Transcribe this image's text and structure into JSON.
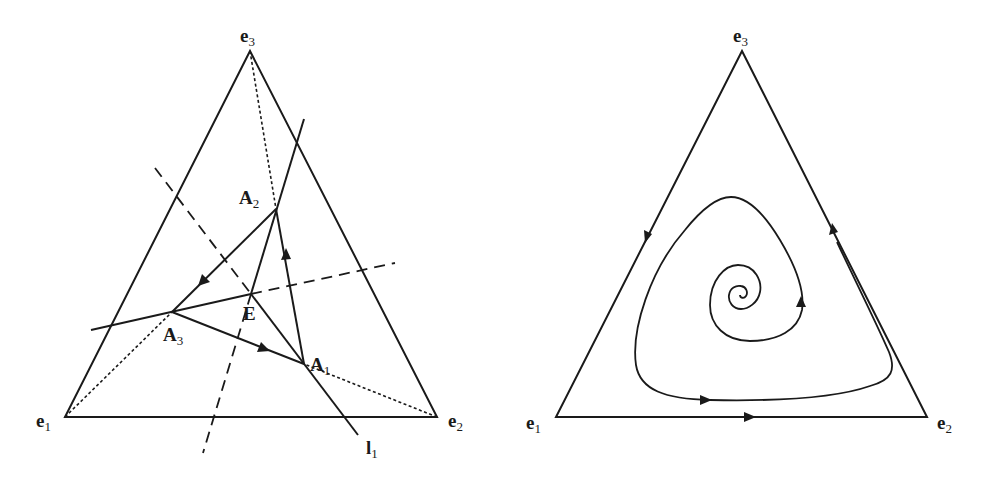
{
  "figure": {
    "panels": [
      {
        "id": "left",
        "description": "Simplex with equilibrium E and triangle A1A2A3",
        "vertices": {
          "e1": {
            "label": "e",
            "sub": "1",
            "x": 65,
            "y": 417
          },
          "e2": {
            "label": "e",
            "sub": "2",
            "x": 437,
            "y": 417
          },
          "e3": {
            "label": "e",
            "sub": "3",
            "x": 250,
            "y": 51
          }
        },
        "points": {
          "A1": {
            "label": "A",
            "sub": "1",
            "x": 304,
            "y": 364
          },
          "A2": {
            "label": "A",
            "sub": "2",
            "x": 276,
            "y": 209
          },
          "A3": {
            "label": "A",
            "sub": "3",
            "x": 172,
            "y": 312
          },
          "E": {
            "label": "E",
            "x": 251,
            "y": 294
          }
        },
        "line_label": {
          "label": "l",
          "sub": "1"
        }
      },
      {
        "id": "right",
        "description": "Simplex with spiral orbit and boundary cycle",
        "vertices": {
          "e1": {
            "label": "e",
            "sub": "1",
            "x": 556,
            "y": 417
          },
          "e2": {
            "label": "e",
            "sub": "2",
            "x": 927,
            "y": 417
          },
          "e3": {
            "label": "e",
            "sub": "3",
            "x": 742,
            "y": 51
          }
        }
      }
    ],
    "stroke_color": "#1a1a1a",
    "background": "#ffffff"
  }
}
